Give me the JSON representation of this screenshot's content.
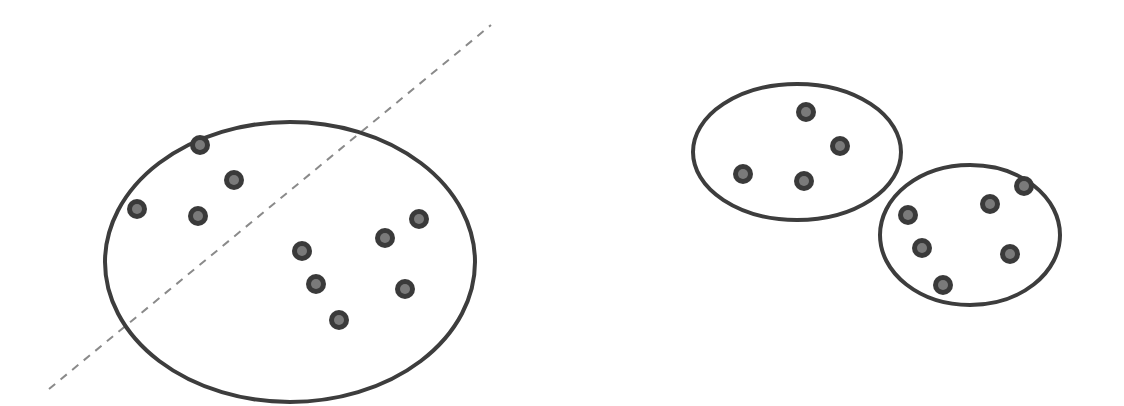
{
  "diagram": {
    "type": "clustering-illustration",
    "colors": {
      "outline": "#3d3d3d",
      "point_ring": "#3a3a3a",
      "point_core": "#7a7a7a",
      "split_line": "#8a8a8a",
      "background": "#ffffff"
    },
    "split_line": {
      "style": "dashed",
      "x1": 49,
      "y1": 389,
      "x2": 491,
      "y2": 25
    },
    "clusters": [
      {
        "name": "large-cluster",
        "shape": "ellipse",
        "cx": 290,
        "cy": 262,
        "rx": 185,
        "ry": 140,
        "points": [
          {
            "x": 200,
            "y": 145
          },
          {
            "x": 234,
            "y": 180
          },
          {
            "x": 137,
            "y": 209
          },
          {
            "x": 198,
            "y": 216
          },
          {
            "x": 302,
            "y": 251
          },
          {
            "x": 385,
            "y": 238
          },
          {
            "x": 419,
            "y": 219
          },
          {
            "x": 316,
            "y": 284
          },
          {
            "x": 405,
            "y": 289
          },
          {
            "x": 339,
            "y": 320
          }
        ]
      },
      {
        "name": "small-cluster-top",
        "shape": "ellipse",
        "cx": 797,
        "cy": 152,
        "rx": 104,
        "ry": 68,
        "points": [
          {
            "x": 806,
            "y": 112
          },
          {
            "x": 840,
            "y": 146
          },
          {
            "x": 743,
            "y": 174
          },
          {
            "x": 804,
            "y": 181
          }
        ]
      },
      {
        "name": "small-cluster-bottom",
        "shape": "ellipse",
        "cx": 970,
        "cy": 235,
        "rx": 90,
        "ry": 70,
        "points": [
          {
            "x": 1024,
            "y": 186
          },
          {
            "x": 990,
            "y": 204
          },
          {
            "x": 908,
            "y": 215
          },
          {
            "x": 922,
            "y": 248
          },
          {
            "x": 1010,
            "y": 254
          },
          {
            "x": 943,
            "y": 285
          }
        ]
      }
    ]
  }
}
